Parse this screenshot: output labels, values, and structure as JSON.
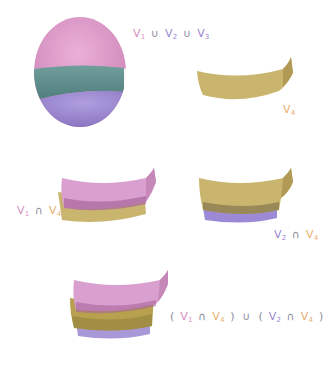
{
  "colors": {
    "v1": "#d68fc2",
    "v2": "#9a86cf",
    "v3": "#5f8f8c",
    "v4": "#c9b56e",
    "v4_label": "#e8b070",
    "operator": "#8c8c9c",
    "background": "#ffffff"
  },
  "panels": [
    {
      "id": "union-v1-v2-v3",
      "shape": "sphere split into three bands",
      "label": {
        "parts": [
          {
            "text": "V",
            "sub": "1",
            "color": "v1"
          },
          {
            "op": "∪"
          },
          {
            "text": "V",
            "sub": "2",
            "color": "v2"
          },
          {
            "op": "∪"
          },
          {
            "text": "V",
            "sub": "3",
            "color": "v2"
          }
        ]
      }
    },
    {
      "id": "v4",
      "shape": "curved band",
      "label": {
        "parts": [
          {
            "text": "V",
            "sub": "4",
            "color": "v4"
          }
        ]
      }
    },
    {
      "id": "v1-intersect-v4",
      "shape": "pink band over gold band",
      "label": {
        "parts": [
          {
            "text": "V",
            "sub": "1",
            "color": "v1"
          },
          {
            "op": "∩"
          },
          {
            "text": "V",
            "sub": "4",
            "color": "v4"
          }
        ]
      }
    },
    {
      "id": "v2-intersect-v4",
      "shape": "gold band over purple band",
      "label": {
        "parts": [
          {
            "text": "V",
            "sub": "2",
            "color": "v2"
          },
          {
            "op": "∩"
          },
          {
            "text": "V",
            "sub": "4",
            "color": "v4"
          }
        ]
      }
    },
    {
      "id": "union-of-intersections",
      "shape": "pink, gold, purple stacked bands",
      "label": {
        "parts": [
          {
            "op": "("
          },
          {
            "text": "V",
            "sub": "1",
            "color": "v1"
          },
          {
            "op": "∩"
          },
          {
            "text": "V",
            "sub": "4",
            "color": "v4"
          },
          {
            "op": ")"
          },
          {
            "op": "∪"
          },
          {
            "op": "("
          },
          {
            "text": "V",
            "sub": "2",
            "color": "v2"
          },
          {
            "op": "∩"
          },
          {
            "text": "V",
            "sub": "4",
            "color": "v4"
          },
          {
            "op": ")"
          }
        ]
      }
    }
  ],
  "labels": {
    "l1": {
      "v": "V",
      "s1": "1",
      "op1": "∪",
      "s2": "2",
      "op2": "∪",
      "s3": "3"
    },
    "l2": {
      "v": "V",
      "s": "4"
    },
    "l3": {
      "v": "V",
      "s1": "1",
      "op": "∩",
      "s2": "4"
    },
    "l4": {
      "v": "V",
      "s1": "2",
      "op": "∩",
      "s2": "4"
    },
    "l5": {
      "lp": "(",
      "v": "V",
      "s1": "1",
      "op1": "∩",
      "s2": "4",
      "rp": ")",
      "u": "∪",
      "s3": "2",
      "op2": "∩",
      "s4": "4"
    }
  }
}
